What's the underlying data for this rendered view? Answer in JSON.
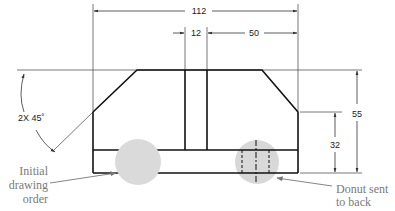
{
  "drawing": {
    "dimensions": {
      "overall_width": "112",
      "slot_width": "12",
      "right_offset": "50",
      "overall_height": "55",
      "shoulder_height": "32",
      "chamfer": "2X  45˚"
    },
    "annotations": {
      "left_line1": "Initial",
      "left_line2": "drawing",
      "left_line3": "order",
      "right_line1": "Donut sent",
      "right_line2": "to back"
    },
    "colors": {
      "object_line": "#111111",
      "thin_line": "#555555",
      "donut_fill": "#d6d6d6",
      "annotation_text": "#7a7a7a"
    }
  }
}
